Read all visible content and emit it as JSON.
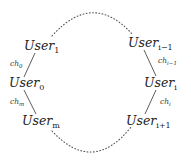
{
  "diagram": {
    "type": "ring-of-users",
    "colors": {
      "text": "#222222",
      "edge": "#333333",
      "dotted_arc": "#555555",
      "background": "#ffffff"
    },
    "nodes": [
      {
        "id": "user_1",
        "base": "User",
        "sub": "1",
        "side": "left"
      },
      {
        "id": "user_0",
        "base": "User",
        "sub": "0",
        "side": "left"
      },
      {
        "id": "user_m",
        "base": "User",
        "sub": "m",
        "side": "left"
      },
      {
        "id": "user_i_minus_1",
        "base": "User",
        "sub": "i−1",
        "side": "right"
      },
      {
        "id": "user_i",
        "base": "User",
        "sub": "i",
        "side": "right"
      },
      {
        "id": "user_i_plus_1",
        "base": "User",
        "sub": "i+1",
        "side": "right"
      }
    ],
    "edges": [
      {
        "from": "user_1",
        "to": "user_0",
        "label_base": "ch",
        "label_sub": "0",
        "style": "solid"
      },
      {
        "from": "user_0",
        "to": "user_m",
        "label_base": "ch",
        "label_sub": "m",
        "style": "solid"
      },
      {
        "from": "user_i_minus_1",
        "to": "user_i",
        "label_base": "ch",
        "label_sub": "i−1",
        "style": "solid"
      },
      {
        "from": "user_i",
        "to": "user_i_plus_1",
        "label_base": "ch",
        "label_sub": "i",
        "style": "solid"
      },
      {
        "from": "user_1",
        "to": "user_i_minus_1",
        "label_base": "",
        "label_sub": "",
        "style": "dotted-arc-top"
      },
      {
        "from": "user_m",
        "to": "user_i_plus_1",
        "label_base": "",
        "label_sub": "",
        "style": "dotted-arc-bottom"
      }
    ]
  }
}
